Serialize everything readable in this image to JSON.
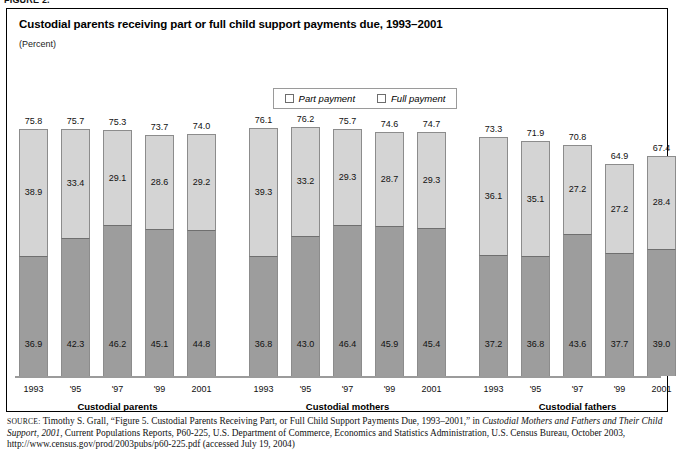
{
  "page": {
    "top_crop_text": "FIGURE 2."
  },
  "chart": {
    "title": "Custodial parents receiving part or full child support payments due, 1993–2001",
    "subtitle": "(Percent)",
    "legend": [
      {
        "label": "Part payment",
        "color": "#d4d4d4",
        "key": "part"
      },
      {
        "label": "Full payment",
        "color": "#9d9d9d",
        "key": "full"
      }
    ],
    "groups": [
      {
        "name": "Custodial parents",
        "ticks": [
          "1993",
          "'95",
          "'97",
          "'99",
          "2001"
        ],
        "totals": [
          "75.8",
          "75.7",
          "75.3",
          "73.7",
          "74.0"
        ],
        "part": [
          "38.9",
          "33.4",
          "29.1",
          "28.6",
          "29.2"
        ],
        "full": [
          "36.9",
          "42.3",
          "46.2",
          "45.1",
          "44.8"
        ]
      },
      {
        "name": "Custodial mothers",
        "ticks": [
          "1993",
          "'95",
          "'97",
          "'99",
          "2001"
        ],
        "totals": [
          "76.1",
          "76.2",
          "75.7",
          "74.6",
          "74.7"
        ],
        "part": [
          "39.3",
          "33.2",
          "29.3",
          "28.7",
          "29.3"
        ],
        "full": [
          "36.8",
          "43.0",
          "46.4",
          "45.9",
          "45.4"
        ]
      },
      {
        "name": "Custodial fathers",
        "ticks": [
          "1993",
          "'95",
          "'97",
          "'99",
          "2001"
        ],
        "totals": [
          "73.3",
          "71.9",
          "70.8",
          "64.9",
          "67.4"
        ],
        "part": [
          "36.1",
          "35.1",
          "27.2",
          "27.2",
          "28.4"
        ],
        "full": [
          "37.2",
          "36.8",
          "43.6",
          "37.7",
          "39.0"
        ]
      }
    ]
  },
  "source": {
    "label": "SOURCE:",
    "text_1": " Timothy S. Grall, “Figure 5. Custodial Parents Receiving Part, or Full Child Support Payments Due, 1993–2001,” in ",
    "italic_1": "Custodial Mothers and Fathers and Their Child Support, 2001",
    "text_2": ", Current Populations Reports, P60-225, U.S. Department of Commerce, Economics and Statistics Administration, U.S. Census Bureau, October 2003, http://www.census.gov/prod/2003pubs/p60-225.pdf (accessed July 19, 2004)"
  },
  "chart_data": {
    "type": "bar",
    "title": "Custodial parents receiving part or full child support payments due, 1993–2001",
    "subtitle": "(Percent)",
    "xlabel": "",
    "ylabel": "Percent",
    "ylim": [
      0,
      80
    ],
    "grid": false,
    "stacked": true,
    "legend_position": "top-center",
    "legend_entries": [
      "Part payment",
      "Full payment"
    ],
    "panels": [
      {
        "name": "Custodial parents",
        "categories": [
          "1993",
          "'95",
          "'97",
          "'99",
          "2001"
        ],
        "series": [
          {
            "name": "Full payment",
            "values": [
              36.9,
              42.3,
              46.2,
              45.1,
              44.8
            ]
          },
          {
            "name": "Part payment",
            "values": [
              38.9,
              33.4,
              29.1,
              28.6,
              29.2
            ]
          }
        ],
        "totals": [
          75.8,
          75.7,
          75.3,
          73.7,
          74.0
        ]
      },
      {
        "name": "Custodial mothers",
        "categories": [
          "1993",
          "'95",
          "'97",
          "'99",
          "2001"
        ],
        "series": [
          {
            "name": "Full payment",
            "values": [
              36.8,
              43.0,
              46.4,
              45.9,
              45.4
            ]
          },
          {
            "name": "Part payment",
            "values": [
              39.3,
              33.2,
              29.3,
              28.7,
              29.3
            ]
          }
        ],
        "totals": [
          76.1,
          76.2,
          75.7,
          74.6,
          74.7
        ]
      },
      {
        "name": "Custodial fathers",
        "categories": [
          "1993",
          "'95",
          "'97",
          "'99",
          "2001"
        ],
        "series": [
          {
            "name": "Full payment",
            "values": [
              37.2,
              36.8,
              43.6,
              37.7,
              39.0
            ]
          },
          {
            "name": "Part payment",
            "values": [
              36.1,
              35.1,
              27.2,
              27.2,
              28.4
            ]
          }
        ],
        "totals": [
          73.3,
          71.9,
          70.8,
          64.9,
          67.4
        ]
      }
    ]
  }
}
